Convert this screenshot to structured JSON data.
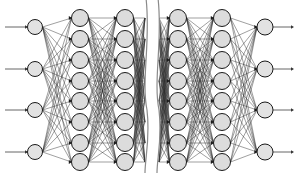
{
  "figure": {
    "type": "neural-network-diagram",
    "canvas": {
      "width": 298,
      "height": 173
    },
    "background_color": "#ffffff"
  },
  "colors": {
    "node_fill": "#dcdcdc",
    "node_stroke": "#1a1a1a",
    "edge": "#2b2b2b",
    "io_edge": "#555555",
    "break_line": "#8a8a8a",
    "arrow_head": "#1a1a1a"
  },
  "network": {
    "layers": [
      {
        "name": "input-layer",
        "role": "input",
        "node_count": 4,
        "x": 35,
        "radius": 7.5,
        "y_positions": [
          27,
          69,
          110,
          152
        ]
      },
      {
        "name": "hidden-layer-1",
        "role": "hidden",
        "node_count": 8,
        "x": 80,
        "radius": 8.5,
        "y_positions": [
          18,
          39,
          60,
          81,
          101,
          122,
          143,
          162
        ]
      },
      {
        "name": "hidden-layer-2",
        "role": "hidden",
        "node_count": 8,
        "x": 125,
        "radius": 8.5,
        "y_positions": [
          18,
          39,
          60,
          81,
          101,
          122,
          143,
          162
        ]
      },
      {
        "name": "hidden-layer-3",
        "role": "hidden",
        "node_count": 8,
        "x": 178,
        "radius": 8.5,
        "y_positions": [
          18,
          39,
          60,
          81,
          101,
          122,
          143,
          162
        ]
      },
      {
        "name": "hidden-layer-4",
        "role": "hidden",
        "node_count": 8,
        "x": 222,
        "radius": 8.5,
        "y_positions": [
          18,
          39,
          60,
          81,
          101,
          122,
          143,
          162
        ]
      },
      {
        "name": "output-layer",
        "role": "output",
        "node_count": 4,
        "x": 265,
        "radius": 8.0,
        "y_positions": [
          27,
          69,
          110,
          152
        ]
      }
    ],
    "connections": [
      {
        "from": "input-layer",
        "to": "hidden-layer-1",
        "style": "fully-connected"
      },
      {
        "from": "hidden-layer-1",
        "to": "hidden-layer-2",
        "style": "fully-connected"
      },
      {
        "from": "hidden-layer-3",
        "to": "hidden-layer-4",
        "style": "fully-connected"
      },
      {
        "from": "hidden-layer-4",
        "to": "output-layer",
        "style": "fully-connected"
      }
    ],
    "truncated_connections": [
      {
        "from": "hidden-layer-2",
        "to": "break",
        "style": "fully-connected-clipped"
      },
      {
        "from": "break",
        "to": "hidden-layer-3",
        "style": "fully-connected-clipped"
      }
    ],
    "break_indicator": {
      "name": "layer-omission-break",
      "description": "S-curved double line indicating omitted intermediate layers",
      "x_left": 146,
      "x_right": 158,
      "curve_amplitude": 5
    },
    "input_arrows": {
      "name": "input-arrows",
      "count": 4,
      "x_start": 5,
      "x_end": 27,
      "direction": "right"
    },
    "output_arrows": {
      "name": "output-arrows",
      "count": 4,
      "x_start": 273,
      "x_end": 294,
      "direction": "right"
    }
  }
}
